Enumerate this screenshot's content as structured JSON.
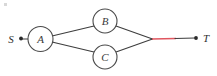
{
  "figure": {
    "type": "flow-network-diagram",
    "width": 217,
    "height": 76,
    "background_color": "#ffffff"
  },
  "colors": {
    "edge_black": "#3d3d3d",
    "edge_red": "#e0565f",
    "node_stroke": "#4a4a4a",
    "node_fill": "#ffffff",
    "label_text": "#3a3a3a",
    "endpoint_dot": "#2a2a2a"
  },
  "nodes": [
    {
      "id": "S",
      "label": "S",
      "kind": "terminal",
      "shape": "dot",
      "cx": 21,
      "cy": 39,
      "label_x": 11,
      "label_y": 43
    },
    {
      "id": "A",
      "label": "A",
      "kind": "circle",
      "shape": "circle",
      "cx": 40.5,
      "cy": 39,
      "r": 12.5,
      "label_x": 40.5,
      "label_y": 43
    },
    {
      "id": "B",
      "label": "B",
      "kind": "circle",
      "shape": "circle",
      "cx": 105,
      "cy": 21,
      "r": 12,
      "label_x": 105,
      "label_y": 25
    },
    {
      "id": "C",
      "label": "C",
      "kind": "circle",
      "shape": "circle",
      "cx": 105,
      "cy": 57,
      "r": 12,
      "label_x": 105,
      "label_y": 61
    },
    {
      "id": "J",
      "label": "",
      "kind": "junction",
      "shape": "none",
      "cx": 152,
      "cy": 39
    },
    {
      "id": "T",
      "label": "T",
      "kind": "terminal",
      "shape": "dot",
      "cx": 196,
      "cy": 38,
      "label_x": 206,
      "label_y": 42
    }
  ],
  "edges": [
    {
      "id": "S-A",
      "from": "S",
      "to": "A",
      "color_key": "edge_black",
      "x1": 22,
      "y1": 39,
      "x2": 28,
      "y2": 39
    },
    {
      "id": "A-B",
      "from": "A",
      "to": "B",
      "color_key": "edge_black",
      "x1": 52,
      "y1": 36,
      "x2": 94,
      "y2": 26
    },
    {
      "id": "A-C",
      "from": "A",
      "to": "C",
      "color_key": "edge_black",
      "x1": 52,
      "y1": 42,
      "x2": 94,
      "y2": 52
    },
    {
      "id": "B-J",
      "from": "B",
      "to": "J",
      "color_key": "edge_black",
      "x1": 116,
      "y1": 26,
      "x2": 152,
      "y2": 39
    },
    {
      "id": "C-J",
      "from": "C",
      "to": "J",
      "color_key": "edge_black",
      "x1": 116,
      "y1": 52,
      "x2": 152,
      "y2": 39
    },
    {
      "id": "J-T-red",
      "from": "J",
      "to": "mid",
      "color_key": "edge_red",
      "x1": 152,
      "y1": 39,
      "x2": 176,
      "y2": 38.5
    },
    {
      "id": "mid-T",
      "from": "mid",
      "to": "T",
      "color_key": "edge_black",
      "x1": 176,
      "y1": 38.5,
      "x2": 196,
      "y2": 38
    }
  ],
  "annotations": {
    "highlighted_edge_id": "J-T-red",
    "highlighted_edge_color": "#e0565f"
  }
}
